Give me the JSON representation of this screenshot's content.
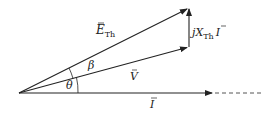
{
  "diagram": {
    "type": "phasor-diagram",
    "colors": {
      "stroke": "#222222",
      "background": "#ffffff"
    },
    "origin": [
      19,
      93
    ],
    "phasors": [
      {
        "id": "E_Th",
        "label": "E",
        "subscript": "Th",
        "overbar": true,
        "from": [
          19,
          93
        ],
        "to": [
          189,
          8
        ]
      },
      {
        "id": "V",
        "label": "V",
        "overbar": true,
        "from": [
          19,
          93
        ],
        "to": [
          189,
          47
        ]
      },
      {
        "id": "jXI",
        "label_prefix": "jX",
        "subscript": "Th",
        "label_suffix": "I",
        "overbar_on_suffix": true,
        "from": [
          189,
          47
        ],
        "to": [
          189,
          8
        ]
      },
      {
        "id": "I",
        "label": "I",
        "overbar": true,
        "from": [
          19,
          93
        ],
        "to": [
          213,
          93
        ],
        "dashed_extension_to": [
          263,
          93
        ]
      }
    ],
    "angles": [
      {
        "id": "theta",
        "label": "θ",
        "between": [
          "I",
          "V"
        ]
      },
      {
        "id": "beta",
        "label": "β",
        "between": [
          "V",
          "E_Th"
        ]
      }
    ],
    "labels": {
      "e_th_main": "E",
      "e_th_sub": "Th",
      "v": "V",
      "i": "I",
      "jx_prefix": "jX",
      "jx_sub": "Th",
      "jx_suffix": "I",
      "theta": "θ",
      "beta": "β"
    }
  }
}
